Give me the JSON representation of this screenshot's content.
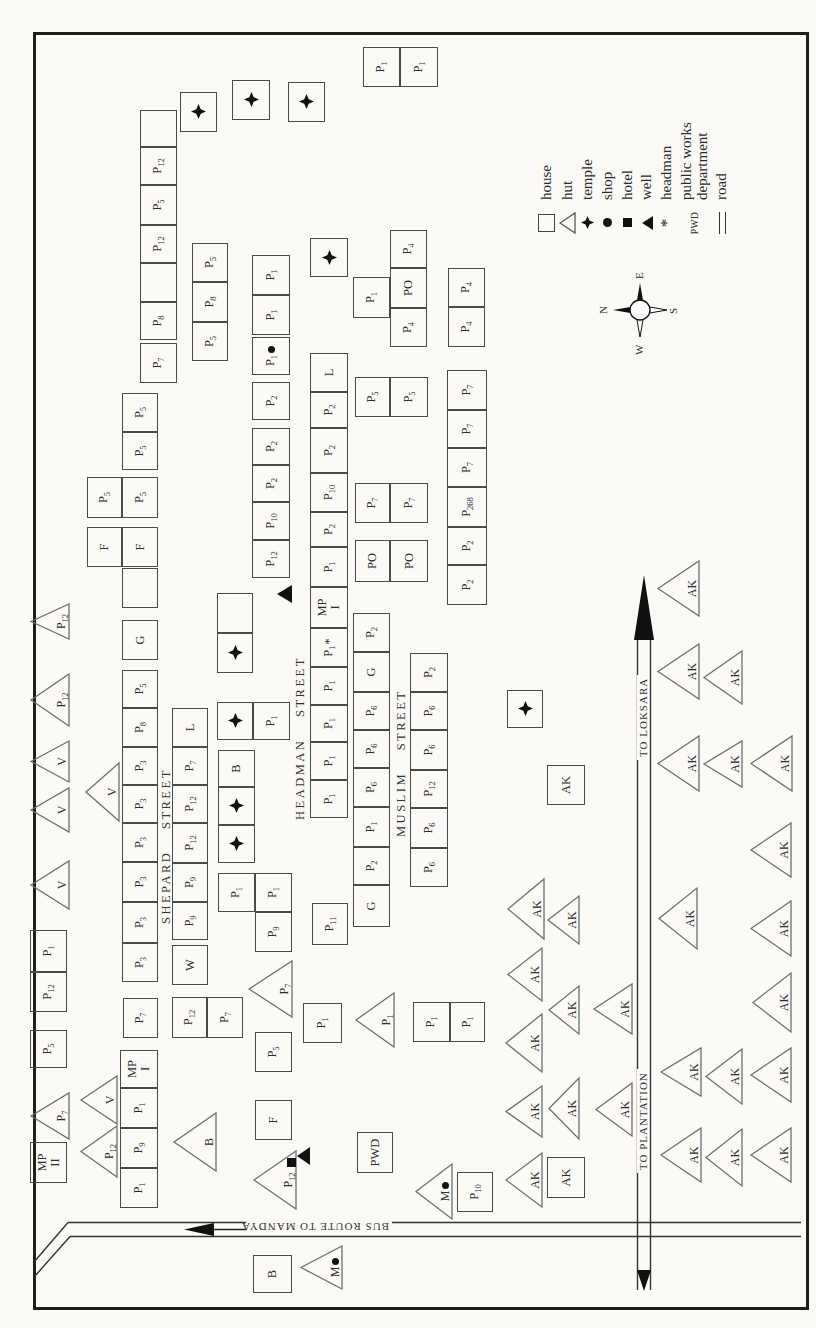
{
  "map_title": "village settlement map",
  "compass": {
    "n": "N",
    "e": "E",
    "s": "S",
    "w": "W",
    "cx": 1018,
    "cy": 640
  },
  "roads": {
    "bus_route": {
      "label": "BUS ROUTE TO MANDYA",
      "x": 98,
      "y": 320
    },
    "to_loksara": {
      "label": "TO LOKSARA",
      "x": 603,
      "y": 644
    },
    "to_plantation": {
      "label": "TO PLANTATION",
      "x": 200,
      "y": 644
    }
  },
  "streets": [
    {
      "name": "SHEPARD STREET",
      "x": 404,
      "y": 159,
      "w": 170
    },
    {
      "name": "HEADMAN STREET",
      "x": 508,
      "y": 293,
      "w": 170
    },
    {
      "name": "MUSLIM STREET",
      "x": 491,
      "y": 394,
      "w": 138
    }
  ],
  "legend": {
    "x": 1090,
    "y": 538,
    "items": [
      {
        "symbol": "house",
        "label": "house"
      },
      {
        "symbol": "hut",
        "label": "hut"
      },
      {
        "symbol": "temple",
        "label": "temple"
      },
      {
        "symbol": "shop",
        "label": "shop"
      },
      {
        "symbol": "hotel",
        "label": "hotel"
      },
      {
        "symbol": "well",
        "label": "well"
      },
      {
        "symbol": "headman",
        "label": "headman",
        "glyph": "*"
      },
      {
        "symbol": "pwd",
        "label": "public works department",
        "glyph": "PWD"
      },
      {
        "symbol": "road",
        "label": "road"
      }
    ]
  },
  "map_items": [
    {
      "t": "h",
      "l": "MP|II",
      "x": 145,
      "y": 30,
      "w": 41,
      "h": 37
    },
    {
      "t": "h",
      "l": "P_5",
      "x": 260,
      "y": 30,
      "w": 38,
      "h": 37
    },
    {
      "t": "h",
      "l": "P_12",
      "x": 316,
      "y": 30,
      "w": 40,
      "h": 37
    },
    {
      "t": "h",
      "l": "P_1",
      "x": 356,
      "y": 30,
      "w": 42,
      "h": 37
    },
    {
      "t": "h",
      "l": "P_1",
      "x": 120,
      "y": 120,
      "w": 40,
      "h": 38
    },
    {
      "t": "h",
      "l": "P_9",
      "x": 160,
      "y": 120,
      "w": 40,
      "h": 38
    },
    {
      "t": "h",
      "l": "P_1",
      "x": 200,
      "y": 120,
      "w": 40,
      "h": 38
    },
    {
      "t": "h",
      "l": "MP|I",
      "x": 240,
      "y": 120,
      "w": 38,
      "h": 38
    },
    {
      "t": "h",
      "l": "P_7",
      "x": 290,
      "y": 123,
      "w": 40,
      "h": 35
    },
    {
      "t": "h",
      "l": "P_3",
      "x": 346,
      "y": 122,
      "w": 39,
      "h": 36
    },
    {
      "t": "h",
      "l": "P_3",
      "x": 385,
      "y": 122,
      "w": 41,
      "h": 36
    },
    {
      "t": "h",
      "l": "P_3",
      "x": 426,
      "y": 122,
      "w": 40,
      "h": 36
    },
    {
      "t": "h",
      "l": "P_3",
      "x": 466,
      "y": 122,
      "w": 39,
      "h": 36
    },
    {
      "t": "h",
      "l": "P_3",
      "x": 505,
      "y": 122,
      "w": 38,
      "h": 36
    },
    {
      "t": "h",
      "l": "P_3",
      "x": 543,
      "y": 122,
      "w": 38,
      "h": 36
    },
    {
      "t": "h",
      "l": "P_8",
      "x": 581,
      "y": 122,
      "w": 39,
      "h": 36
    },
    {
      "t": "h",
      "l": "P_5",
      "x": 620,
      "y": 122,
      "w": 38,
      "h": 36
    },
    {
      "t": "h",
      "l": "G",
      "x": 668,
      "y": 122,
      "w": 40,
      "h": 36
    },
    {
      "t": "h",
      "l": "",
      "x": 720,
      "y": 122,
      "w": 40,
      "h": 36
    },
    {
      "t": "h",
      "l": "F",
      "x": 761,
      "y": 122,
      "w": 40,
      "h": 36
    },
    {
      "t": "h",
      "l": "P_5",
      "x": 810,
      "y": 122,
      "w": 41,
      "h": 36
    },
    {
      "t": "h",
      "l": "P_5",
      "x": 858,
      "y": 122,
      "w": 38,
      "h": 36
    },
    {
      "t": "h",
      "l": "P_5",
      "x": 896,
      "y": 122,
      "w": 39,
      "h": 36
    },
    {
      "t": "h",
      "l": "F",
      "x": 761,
      "y": 87,
      "w": 40,
      "h": 35
    },
    {
      "t": "h",
      "l": "P_5",
      "x": 810,
      "y": 87,
      "w": 41,
      "h": 35
    },
    {
      "t": "h",
      "l": "P_12",
      "x": 290,
      "y": 172,
      "w": 41,
      "h": 35
    },
    {
      "t": "h",
      "l": "P_7",
      "x": 290,
      "y": 207,
      "w": 41,
      "h": 36
    },
    {
      "t": "h",
      "l": "W",
      "x": 343,
      "y": 172,
      "w": 40,
      "h": 36
    },
    {
      "t": "h",
      "l": "P_9",
      "x": 388,
      "y": 172,
      "w": 38,
      "h": 36
    },
    {
      "t": "h",
      "l": "P_9",
      "x": 426,
      "y": 172,
      "w": 39,
      "h": 36
    },
    {
      "t": "h",
      "l": "P_12",
      "x": 465,
      "y": 172,
      "w": 40,
      "h": 36
    },
    {
      "t": "h",
      "l": "P_12",
      "x": 505,
      "y": 172,
      "w": 38,
      "h": 36
    },
    {
      "t": "h",
      "l": "P_7",
      "x": 543,
      "y": 172,
      "w": 38,
      "h": 36
    },
    {
      "t": "h",
      "l": "L",
      "x": 581,
      "y": 172,
      "w": 39,
      "h": 36
    },
    {
      "t": "h",
      "l": "P_9",
      "x": 376,
      "y": 255,
      "w": 40,
      "h": 37
    },
    {
      "t": "h",
      "l": "P_1",
      "x": 416,
      "y": 218,
      "w": 39,
      "h": 37
    },
    {
      "t": "h",
      "l": "P_1",
      "x": 416,
      "y": 255,
      "w": 39,
      "h": 37
    },
    {
      "t": "h",
      "l": "B",
      "x": 541,
      "y": 218,
      "w": 37,
      "h": 37
    },
    {
      "t": "h",
      "l": "P_1",
      "x": 588,
      "y": 253,
      "w": 38,
      "h": 37
    },
    {
      "t": "h",
      "l": "",
      "x": 695,
      "y": 217,
      "w": 40,
      "h": 36
    },
    {
      "t": "h",
      "l": "P_1",
      "x": 510,
      "y": 310,
      "w": 38,
      "h": 38
    },
    {
      "t": "h",
      "l": "P_1",
      "x": 548,
      "y": 310,
      "w": 38,
      "h": 38
    },
    {
      "t": "h",
      "l": "P_1",
      "x": 586,
      "y": 310,
      "w": 37,
      "h": 38
    },
    {
      "t": "h",
      "l": "P_1",
      "x": 623,
      "y": 310,
      "w": 38,
      "h": 38
    },
    {
      "t": "h",
      "l": "P_1",
      "x": 661,
      "y": 310,
      "w": 39,
      "h": 38,
      "m": "head"
    },
    {
      "t": "h",
      "l": "MP|I",
      "x": 700,
      "y": 310,
      "w": 41,
      "h": 38
    },
    {
      "t": "h",
      "l": "P_1",
      "x": 741,
      "y": 310,
      "w": 40,
      "h": 38
    },
    {
      "t": "h",
      "l": "P_2",
      "x": 781,
      "y": 310,
      "w": 35,
      "h": 38
    },
    {
      "t": "h",
      "l": "P_10",
      "x": 816,
      "y": 310,
      "w": 39,
      "h": 38
    },
    {
      "t": "h",
      "l": "P_2",
      "x": 855,
      "y": 310,
      "w": 45,
      "h": 38
    },
    {
      "t": "h",
      "l": "P_2",
      "x": 900,
      "y": 310,
      "w": 36,
      "h": 38
    },
    {
      "t": "h",
      "l": "L",
      "x": 936,
      "y": 310,
      "w": 39,
      "h": 38
    },
    {
      "t": "h",
      "l": "P_11",
      "x": 383,
      "y": 312,
      "w": 42,
      "h": 36
    },
    {
      "t": "h",
      "l": "G",
      "x": 401,
      "y": 353,
      "w": 42,
      "h": 37
    },
    {
      "t": "h",
      "l": "P_2",
      "x": 443,
      "y": 353,
      "w": 38,
      "h": 37
    },
    {
      "t": "h",
      "l": "P_1",
      "x": 481,
      "y": 353,
      "w": 40,
      "h": 37
    },
    {
      "t": "h",
      "l": "P_6",
      "x": 521,
      "y": 353,
      "w": 39,
      "h": 37
    },
    {
      "t": "h",
      "l": "P_6",
      "x": 560,
      "y": 353,
      "w": 38,
      "h": 37
    },
    {
      "t": "h",
      "l": "P_6",
      "x": 598,
      "y": 353,
      "w": 38,
      "h": 37
    },
    {
      "t": "h",
      "l": "G",
      "x": 636,
      "y": 353,
      "w": 40,
      "h": 37
    },
    {
      "t": "h",
      "l": "P_2",
      "x": 676,
      "y": 353,
      "w": 39,
      "h": 37
    },
    {
      "t": "h",
      "l": "P_6",
      "x": 441,
      "y": 410,
      "w": 39,
      "h": 38
    },
    {
      "t": "h",
      "l": "P_6",
      "x": 480,
      "y": 410,
      "w": 40,
      "h": 38
    },
    {
      "t": "h",
      "l": "P_12",
      "x": 520,
      "y": 410,
      "w": 38,
      "h": 38
    },
    {
      "t": "h",
      "l": "P_6",
      "x": 558,
      "y": 410,
      "w": 40,
      "h": 38
    },
    {
      "t": "h",
      "l": "P_6",
      "x": 598,
      "y": 410,
      "w": 38,
      "h": 38
    },
    {
      "t": "h",
      "l": "P_2",
      "x": 636,
      "y": 410,
      "w": 39,
      "h": 38
    },
    {
      "t": "h",
      "l": "PO",
      "x": 746,
      "y": 355,
      "w": 42,
      "h": 35
    },
    {
      "t": "h",
      "l": "PO",
      "x": 746,
      "y": 390,
      "w": 42,
      "h": 38
    },
    {
      "t": "h",
      "l": "P_7",
      "x": 805,
      "y": 355,
      "w": 40,
      "h": 35
    },
    {
      "t": "h",
      "l": "P_7",
      "x": 805,
      "y": 390,
      "w": 40,
      "h": 38
    },
    {
      "t": "h",
      "l": "P_5",
      "x": 911,
      "y": 355,
      "w": 40,
      "h": 35
    },
    {
      "t": "h",
      "l": "P_5",
      "x": 911,
      "y": 390,
      "w": 40,
      "h": 38
    },
    {
      "t": "h",
      "l": "P_2",
      "x": 723,
      "y": 447,
      "w": 40,
      "h": 40
    },
    {
      "t": "h",
      "l": "P_2",
      "x": 763,
      "y": 447,
      "w": 38,
      "h": 40
    },
    {
      "t": "h",
      "l": "P_268",
      "x": 801,
      "y": 447,
      "w": 40,
      "h": 40
    },
    {
      "t": "h",
      "l": "P_7",
      "x": 841,
      "y": 447,
      "w": 39,
      "h": 40
    },
    {
      "t": "h",
      "l": "P_7",
      "x": 880,
      "y": 447,
      "w": 38,
      "h": 40
    },
    {
      "t": "h",
      "l": "P_7",
      "x": 918,
      "y": 447,
      "w": 40,
      "h": 40
    },
    {
      "t": "h",
      "l": "P_12",
      "x": 750,
      "y": 252,
      "w": 38,
      "h": 38
    },
    {
      "t": "h",
      "l": "P_10",
      "x": 788,
      "y": 252,
      "w": 38,
      "h": 38
    },
    {
      "t": "h",
      "l": "P_2",
      "x": 826,
      "y": 252,
      "w": 37,
      "h": 38
    },
    {
      "t": "h",
      "l": "P_2",
      "x": 863,
      "y": 252,
      "w": 37,
      "h": 38
    },
    {
      "t": "h",
      "l": "P_2",
      "x": 908,
      "y": 252,
      "w": 38,
      "h": 38
    },
    {
      "t": "h",
      "l": "P_1",
      "x": 953,
      "y": 252,
      "w": 38,
      "h": 38,
      "m": "shop"
    },
    {
      "t": "h",
      "l": "P_1",
      "x": 993,
      "y": 252,
      "w": 40,
      "h": 38
    },
    {
      "t": "h",
      "l": "P_1",
      "x": 1033,
      "y": 252,
      "w": 40,
      "h": 38
    },
    {
      "t": "h",
      "l": "P_5",
      "x": 967,
      "y": 192,
      "w": 39,
      "h": 36
    },
    {
      "t": "h",
      "l": "P_8",
      "x": 1006,
      "y": 192,
      "w": 40,
      "h": 36
    },
    {
      "t": "h",
      "l": "P_5",
      "x": 1046,
      "y": 192,
      "w": 39,
      "h": 36
    },
    {
      "t": "h",
      "l": "P_7",
      "x": 945,
      "y": 140,
      "w": 40,
      "h": 37
    },
    {
      "t": "h",
      "l": "P_8",
      "x": 988,
      "y": 140,
      "w": 38,
      "h": 37
    },
    {
      "t": "h",
      "l": "",
      "x": 1026,
      "y": 140,
      "w": 39,
      "h": 37
    },
    {
      "t": "h",
      "l": "P_12",
      "x": 1065,
      "y": 140,
      "w": 38,
      "h": 37
    },
    {
      "t": "h",
      "l": "P_5",
      "x": 1103,
      "y": 140,
      "w": 40,
      "h": 37
    },
    {
      "t": "h",
      "l": "P_12",
      "x": 1143,
      "y": 140,
      "w": 38,
      "h": 37
    },
    {
      "t": "h",
      "l": "",
      "x": 1181,
      "y": 140,
      "w": 37,
      "h": 37
    },
    {
      "t": "h",
      "l": "P_1",
      "x": 1241,
      "y": 363,
      "w": 40,
      "h": 37
    },
    {
      "t": "h",
      "l": "P_1",
      "x": 1241,
      "y": 400,
      "w": 40,
      "h": 38
    },
    {
      "t": "h",
      "l": "P_1",
      "x": 1010,
      "y": 353,
      "w": 41,
      "h": 37
    },
    {
      "t": "h",
      "l": "P_4",
      "x": 981,
      "y": 390,
      "w": 39,
      "h": 37
    },
    {
      "t": "h",
      "l": "PO",
      "x": 1020,
      "y": 390,
      "w": 40,
      "h": 37
    },
    {
      "t": "h",
      "l": "P_4",
      "x": 1060,
      "y": 390,
      "w": 38,
      "h": 37
    },
    {
      "t": "h",
      "l": "P_4",
      "x": 981,
      "y": 448,
      "w": 40,
      "h": 37
    },
    {
      "t": "h",
      "l": "P_4",
      "x": 1021,
      "y": 448,
      "w": 39,
      "h": 37
    },
    {
      "t": "h",
      "l": "F",
      "x": 188,
      "y": 255,
      "w": 40,
      "h": 37
    },
    {
      "t": "h",
      "l": "P_5",
      "x": 256,
      "y": 255,
      "w": 40,
      "h": 37
    },
    {
      "t": "h",
      "l": "P_1",
      "x": 285,
      "y": 303,
      "w": 40,
      "h": 39
    },
    {
      "t": "h",
      "l": "PWD",
      "x": 155,
      "y": 357,
      "w": 41,
      "h": 36
    },
    {
      "t": "h",
      "l": "P_1",
      "x": 286,
      "y": 413,
      "w": 40,
      "h": 37
    },
    {
      "t": "h",
      "l": "P_1",
      "x": 286,
      "y": 450,
      "w": 40,
      "h": 35
    },
    {
      "t": "h",
      "l": "P_10",
      "x": 116,
      "y": 457,
      "w": 40,
      "h": 36
    },
    {
      "t": "h",
      "l": "B",
      "x": 35,
      "y": 253,
      "w": 38,
      "h": 39
    },
    {
      "t": "h",
      "l": "AK",
      "x": 523,
      "y": 547,
      "w": 40,
      "h": 38
    },
    {
      "t": "h",
      "l": "AK",
      "x": 130,
      "y": 547,
      "w": 41,
      "h": 38
    },
    {
      "t": "s",
      "l": "",
      "x": 1196,
      "y": 180,
      "w": 40,
      "h": 37
    },
    {
      "t": "s",
      "l": "",
      "x": 1208,
      "y": 232,
      "w": 40,
      "h": 38
    },
    {
      "t": "s",
      "l": "",
      "x": 1206,
      "y": 288,
      "w": 40,
      "h": 37
    },
    {
      "t": "s",
      "l": "",
      "x": 1051,
      "y": 310,
      "w": 39,
      "h": 38
    },
    {
      "t": "s",
      "l": "",
      "x": 655,
      "y": 217,
      "w": 40,
      "h": 36
    },
    {
      "t": "s",
      "l": "",
      "x": 588,
      "y": 217,
      "w": 38,
      "h": 36
    },
    {
      "t": "s",
      "l": "",
      "x": 503,
      "y": 218,
      "w": 38,
      "h": 37
    },
    {
      "t": "s",
      "l": "",
      "x": 465,
      "y": 218,
      "w": 38,
      "h": 37
    },
    {
      "t": "s",
      "l": "",
      "x": 600,
      "y": 507,
      "w": 38,
      "h": 36
    },
    {
      "t": "w",
      "l": "",
      "x": 725,
      "y": 277,
      "w": 18,
      "h": 15
    },
    {
      "t": "w",
      "l": "",
      "x": 163,
      "y": 297,
      "w": 18,
      "h": 13
    },
    {
      "t": "t",
      "l": "P_12",
      "x": 688,
      "y": 30,
      "w": 37,
      "h": 40
    },
    {
      "t": "t",
      "l": "P_12",
      "x": 601,
      "y": 30,
      "w": 54,
      "h": 40
    },
    {
      "t": "t",
      "l": "V",
      "x": 545,
      "y": 30,
      "w": 43,
      "h": 40
    },
    {
      "t": "t",
      "l": "V",
      "x": 495,
      "y": 30,
      "w": 46,
      "h": 40
    },
    {
      "t": "t",
      "l": "V",
      "x": 418,
      "y": 30,
      "w": 50,
      "h": 40
    },
    {
      "t": "t",
      "l": "V",
      "x": 506,
      "y": 85,
      "w": 60,
      "h": 35
    },
    {
      "t": "t",
      "l": "P_7",
      "x": 188,
      "y": 30,
      "w": 48,
      "h": 40
    },
    {
      "t": "t",
      "l": "V",
      "x": 203,
      "y": 80,
      "w": 50,
      "h": 38
    },
    {
      "t": "t",
      "l": "P_12",
      "x": 150,
      "y": 80,
      "w": 53,
      "h": 38
    },
    {
      "t": "t",
      "l": "B",
      "x": 156,
      "y": 173,
      "w": 60,
      "h": 44
    },
    {
      "t": "t",
      "l": "P_7",
      "x": 310,
      "y": 248,
      "w": 58,
      "h": 45
    },
    {
      "t": "t",
      "l": "P_1",
      "x": 280,
      "y": 355,
      "w": 56,
      "h": 40
    },
    {
      "t": "t",
      "l": "P_12",
      "x": 118,
      "y": 253,
      "w": 60,
      "h": 44,
      "m": "hotel"
    },
    {
      "t": "t",
      "l": "M",
      "x": 108,
      "y": 415,
      "w": 57,
      "h": 38,
      "m": "shop"
    },
    {
      "t": "t",
      "l": "M",
      "x": 38,
      "y": 300,
      "w": 45,
      "h": 43,
      "m": "shop"
    },
    {
      "t": "t",
      "l": "AK",
      "x": 388,
      "y": 507,
      "w": 62,
      "h": 38
    },
    {
      "t": "t",
      "l": "AK",
      "x": 383,
      "y": 547,
      "w": 50,
      "h": 33
    },
    {
      "t": "t",
      "l": "AK",
      "x": 326,
      "y": 507,
      "w": 55,
      "h": 36
    },
    {
      "t": "t",
      "l": "AK",
      "x": 293,
      "y": 548,
      "w": 50,
      "h": 32
    },
    {
      "t": "t",
      "l": "AK",
      "x": 293,
      "y": 593,
      "w": 52,
      "h": 40
    },
    {
      "t": "t",
      "l": "AK",
      "x": 255,
      "y": 505,
      "w": 60,
      "h": 38
    },
    {
      "t": "t",
      "l": "AK",
      "x": 190,
      "y": 505,
      "w": 53,
      "h": 38
    },
    {
      "t": "t",
      "l": "AK",
      "x": 188,
      "y": 548,
      "w": 63,
      "h": 32
    },
    {
      "t": "t",
      "l": "AK",
      "x": 191,
      "y": 595,
      "w": 55,
      "h": 38
    },
    {
      "t": "t",
      "l": "AK",
      "x": 120,
      "y": 505,
      "w": 56,
      "h": 38
    },
    {
      "t": "t",
      "l": "AK",
      "x": 711,
      "y": 657,
      "w": 57,
      "h": 43
    },
    {
      "t": "t",
      "l": "AK",
      "x": 628,
      "y": 657,
      "w": 57,
      "h": 43
    },
    {
      "t": "t",
      "l": "AK",
      "x": 623,
      "y": 703,
      "w": 55,
      "h": 40
    },
    {
      "t": "t",
      "l": "AK",
      "x": 536,
      "y": 657,
      "w": 57,
      "h": 43
    },
    {
      "t": "t",
      "l": "AK",
      "x": 540,
      "y": 703,
      "w": 48,
      "h": 40
    },
    {
      "t": "t",
      "l": "AK",
      "x": 536,
      "y": 750,
      "w": 57,
      "h": 43
    },
    {
      "t": "t",
      "l": "AK",
      "x": 450,
      "y": 750,
      "w": 56,
      "h": 42
    },
    {
      "t": "t",
      "l": "AK",
      "x": 378,
      "y": 658,
      "w": 63,
      "h": 40
    },
    {
      "t": "t",
      "l": "AK",
      "x": 371,
      "y": 750,
      "w": 57,
      "h": 42
    },
    {
      "t": "t",
      "l": "AK",
      "x": 295,
      "y": 752,
      "w": 61,
      "h": 40
    },
    {
      "t": "t",
      "l": "AK",
      "x": 231,
      "y": 660,
      "w": 50,
      "h": 42
    },
    {
      "t": "t",
      "l": "AK",
      "x": 223,
      "y": 705,
      "w": 57,
      "h": 38
    },
    {
      "t": "t",
      "l": "AK",
      "x": 225,
      "y": 750,
      "w": 56,
      "h": 42
    },
    {
      "t": "t",
      "l": "AK",
      "x": 145,
      "y": 660,
      "w": 56,
      "h": 42
    },
    {
      "t": "t",
      "l": "AK",
      "x": 141,
      "y": 705,
      "w": 59,
      "h": 38
    },
    {
      "t": "t",
      "l": "AK",
      "x": 145,
      "y": 750,
      "w": 56,
      "h": 42
    }
  ]
}
